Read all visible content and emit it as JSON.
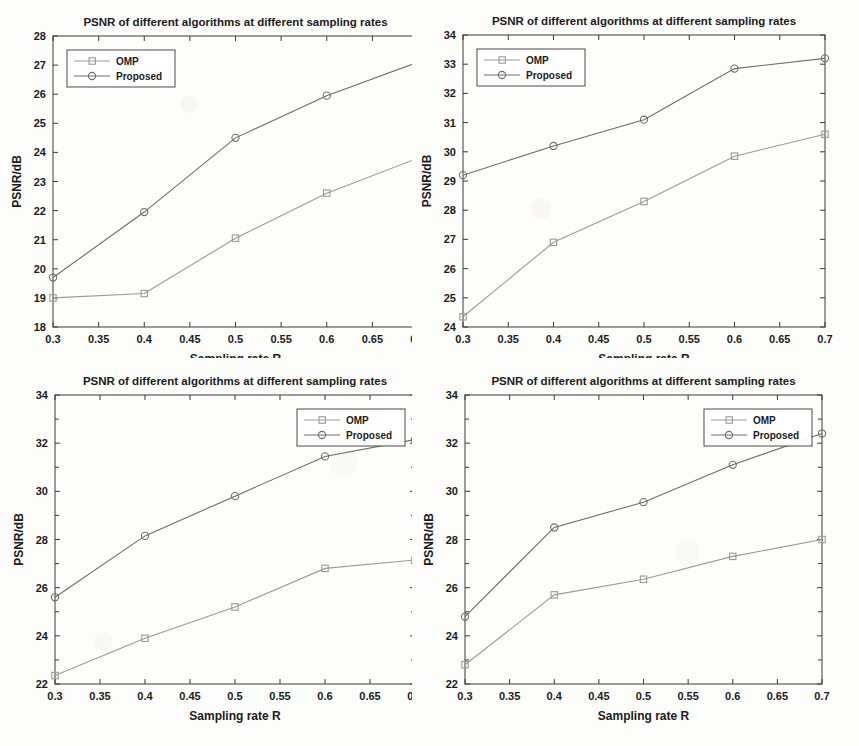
{
  "figure": {
    "common_title": "PSNR of different algorithms at different sampling rates",
    "xlabel": "Sampling rate R",
    "ylabel": "PSNR/dB",
    "legend": {
      "omp": "OMP",
      "proposed": "Proposed"
    },
    "colors": {
      "omp": "#9a9a9a",
      "proposed": "#6d6d6d",
      "axis": "#3a3a3a",
      "text": "#1b1b1b",
      "background": "#fdfdfb"
    },
    "xticks": [
      "0.3",
      "0.35",
      "0.4",
      "0.45",
      "0.5",
      "0.55",
      "0.6",
      "0.65",
      "0.7"
    ],
    "markers": {
      "omp": "square",
      "proposed": "circle"
    }
  },
  "chart_data": [
    {
      "id": "panel-top-left",
      "type": "line",
      "title": "PSNR of different algorithms at different sampling rates",
      "xlabel": "Sampling rate R",
      "ylabel": "PSNR/dB",
      "x": [
        0.3,
        0.4,
        0.5,
        0.6,
        0.7
      ],
      "xlim": [
        0.3,
        0.7
      ],
      "ylim": [
        18,
        28
      ],
      "yticks": [
        "18",
        "19",
        "20",
        "21",
        "22",
        "23",
        "24",
        "25",
        "26",
        "27",
        "28"
      ],
      "ytick_values": [
        18,
        19,
        20,
        21,
        22,
        23,
        24,
        25,
        26,
        27,
        28
      ],
      "xticks": [
        "0.3",
        "0.35",
        "0.4",
        "0.45",
        "0.5",
        "0.55",
        "0.6",
        "0.65",
        "0.7"
      ],
      "xtick_values": [
        0.3,
        0.35,
        0.4,
        0.45,
        0.5,
        0.55,
        0.6,
        0.65,
        0.7
      ],
      "grid": false,
      "legend_position": "top-left",
      "series": [
        {
          "name": "OMP",
          "marker": "square",
          "color": "#9a9a9a",
          "values": [
            19.0,
            19.15,
            21.05,
            22.6,
            23.8
          ]
        },
        {
          "name": "Proposed",
          "marker": "circle",
          "color": "#6d6d6d",
          "values": [
            19.7,
            21.95,
            24.5,
            25.95,
            27.1
          ]
        }
      ]
    },
    {
      "id": "panel-top-right",
      "type": "line",
      "title": "PSNR of different algorithms at different sampling rates",
      "xlabel": "Sampling rate R",
      "ylabel": "PSNR/dB",
      "x": [
        0.3,
        0.4,
        0.5,
        0.6,
        0.7
      ],
      "xlim": [
        0.3,
        0.7
      ],
      "ylim": [
        24,
        34
      ],
      "yticks": [
        "24",
        "25",
        "26",
        "27",
        "28",
        "29",
        "30",
        "31",
        "32",
        "33",
        "34"
      ],
      "ytick_values": [
        24,
        25,
        26,
        27,
        28,
        29,
        30,
        31,
        32,
        33,
        34
      ],
      "xticks": [
        "0.3",
        "0.35",
        "0.4",
        "0.45",
        "0.5",
        "0.55",
        "0.6",
        "0.65",
        "0.7"
      ],
      "xtick_values": [
        0.3,
        0.35,
        0.4,
        0.45,
        0.5,
        0.55,
        0.6,
        0.65,
        0.7
      ],
      "grid": false,
      "legend_position": "top-left",
      "series": [
        {
          "name": "OMP",
          "marker": "square",
          "color": "#9a9a9a",
          "values": [
            24.35,
            26.9,
            28.3,
            29.85,
            30.6
          ]
        },
        {
          "name": "Proposed",
          "marker": "circle",
          "color": "#6d6d6d",
          "values": [
            29.2,
            30.2,
            31.1,
            32.85,
            33.2
          ]
        }
      ]
    },
    {
      "id": "panel-bottom-left",
      "type": "line",
      "title": "PSNR of different algorithms at different sampling rates",
      "xlabel": "Sampling rate R",
      "ylabel": "PSNR/dB",
      "x": [
        0.3,
        0.4,
        0.5,
        0.6,
        0.7
      ],
      "xlim": [
        0.3,
        0.7
      ],
      "ylim": [
        22,
        34
      ],
      "yticks": [
        "22",
        "24",
        "26",
        "28",
        "30",
        "32",
        "34"
      ],
      "ytick_values": [
        22,
        24,
        26,
        28,
        30,
        32,
        34
      ],
      "xticks": [
        "0.3",
        "0.35",
        "0.4",
        "0.45",
        "0.5",
        "0.55",
        "0.6",
        "0.65",
        "0.7"
      ],
      "xtick_values": [
        0.3,
        0.35,
        0.4,
        0.45,
        0.5,
        0.55,
        0.6,
        0.65,
        0.7
      ],
      "grid": false,
      "legend_position": "top-right",
      "series": [
        {
          "name": "OMP",
          "marker": "square",
          "color": "#9a9a9a",
          "values": [
            22.35,
            23.9,
            25.2,
            26.8,
            27.15
          ]
        },
        {
          "name": "Proposed",
          "marker": "circle",
          "color": "#6d6d6d",
          "values": [
            25.6,
            28.15,
            29.8,
            31.45,
            32.15
          ]
        }
      ]
    },
    {
      "id": "panel-bottom-right",
      "type": "line",
      "title": "PSNR of different algorithms at different sampling rates",
      "xlabel": "Sampling rate R",
      "ylabel": "PSNR/dB",
      "x": [
        0.3,
        0.4,
        0.5,
        0.6,
        0.7
      ],
      "xlim": [
        0.3,
        0.7
      ],
      "ylim": [
        22,
        34
      ],
      "yticks": [
        "22",
        "24",
        "26",
        "28",
        "30",
        "32",
        "34"
      ],
      "ytick_values": [
        22,
        24,
        26,
        28,
        30,
        32,
        34
      ],
      "xticks": [
        "0.3",
        "0.35",
        "0.4",
        "0.45",
        "0.5",
        "0.55",
        "0.6",
        "0.65",
        "0.7"
      ],
      "xtick_values": [
        0.3,
        0.35,
        0.4,
        0.45,
        0.5,
        0.55,
        0.6,
        0.65,
        0.7
      ],
      "grid": false,
      "legend_position": "top-right",
      "series": [
        {
          "name": "OMP",
          "marker": "square",
          "color": "#9a9a9a",
          "values": [
            22.8,
            25.7,
            26.35,
            27.3,
            28.0
          ]
        },
        {
          "name": "Proposed",
          "marker": "circle",
          "color": "#6d6d6d",
          "values": [
            24.8,
            28.5,
            29.55,
            31.1,
            32.4
          ]
        }
      ]
    }
  ]
}
